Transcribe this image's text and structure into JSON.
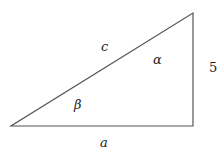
{
  "diagram": {
    "type": "right-triangle",
    "stroke_color": "#555555",
    "vertices": {
      "bottom_left": [
        11,
        126
      ],
      "bottom_right": [
        193,
        126
      ],
      "top_right": [
        193,
        13
      ]
    },
    "labels": {
      "hypotenuse": "c",
      "base": "a",
      "vertical_side": "5",
      "angle_top": "α",
      "angle_left": "β"
    }
  }
}
